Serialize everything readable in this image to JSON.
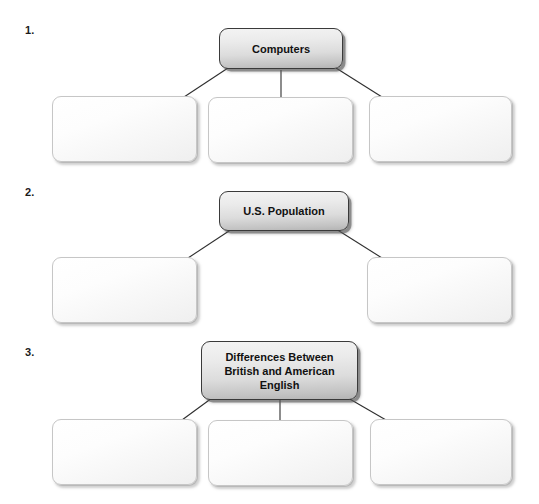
{
  "page": {
    "background_color": "#ffffff",
    "width": 539,
    "height": 504,
    "type": "worksheet-graphic-organizers"
  },
  "style": {
    "title_box_fill_top": "#f3f3f3",
    "title_box_fill_bottom": "#b4b4b4",
    "title_box_border": "#3a3a3a",
    "blank_box_fill": "#ffffff",
    "blank_box_border": "#c6c6c6",
    "connector_color": "#2e2e2e",
    "text_color": "#111111"
  },
  "exercises": [
    {
      "number": "1.",
      "root": {
        "label": "Computers"
      },
      "children": [
        {
          "label": ""
        },
        {
          "label": ""
        },
        {
          "label": ""
        }
      ]
    },
    {
      "number": "2.",
      "root": {
        "label": "U.S. Population"
      },
      "children": [
        {
          "label": ""
        },
        {
          "label": ""
        }
      ]
    },
    {
      "number": "3.",
      "root": {
        "label": "Differences Between British and American English"
      },
      "root_lines": [
        "Differences Between",
        "British and American",
        "English"
      ],
      "children": [
        {
          "label": ""
        },
        {
          "label": ""
        },
        {
          "label": ""
        }
      ]
    }
  ]
}
